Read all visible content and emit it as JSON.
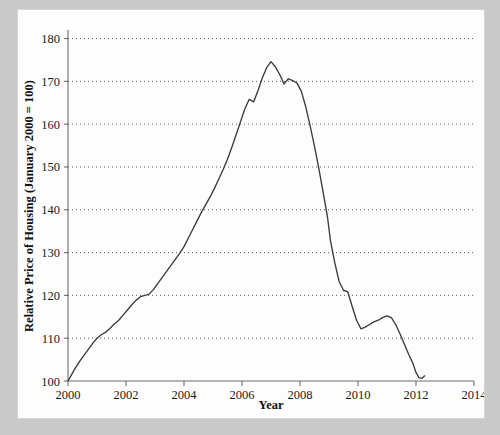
{
  "figure": {
    "background_color": "#c9c9c9",
    "panel_color": "#fdfdfd",
    "line_color": "#3b3b3b"
  },
  "chart_data": {
    "type": "line",
    "title": "",
    "xlabel": "Year",
    "ylabel": "Relative Price of Housing (January 2000 = 100)",
    "xlim": [
      2000,
      2014
    ],
    "ylim": [
      100,
      182
    ],
    "xticks": [
      2000,
      2002,
      2004,
      2006,
      2008,
      2010,
      2012,
      2014
    ],
    "xtick_labels": [
      "2000",
      "2002",
      "2004",
      "2006",
      "2008",
      "2010",
      "2012",
      "2014"
    ],
    "yticks": [
      100,
      110,
      120,
      130,
      140,
      150,
      160,
      170,
      180
    ],
    "ytick_labels": [
      "100",
      "110",
      "120",
      "130",
      "140",
      "150",
      "160",
      "170",
      "180"
    ],
    "grid": "horizontal-dotted",
    "legend": "none",
    "series": [
      {
        "name": "Relative Price of Housing",
        "x": [
          2000.0,
          2000.1,
          2000.25,
          2000.4,
          2000.55,
          2000.7,
          2000.85,
          2001.0,
          2001.15,
          2001.3,
          2001.45,
          2001.6,
          2001.75,
          2001.9,
          2002.05,
          2002.2,
          2002.35,
          2002.5,
          2002.65,
          2002.8,
          2002.95,
          2003.1,
          2003.25,
          2003.4,
          2003.55,
          2003.7,
          2003.85,
          2004.0,
          2004.15,
          2004.3,
          2004.45,
          2004.6,
          2004.75,
          2004.9,
          2005.05,
          2005.2,
          2005.35,
          2005.5,
          2005.65,
          2005.8,
          2005.95,
          2006.1,
          2006.25,
          2006.4,
          2006.55,
          2006.7,
          2006.85,
          2007.0,
          2007.15,
          2007.3,
          2007.45,
          2007.6,
          2007.75,
          2007.9,
          2008.05,
          2008.2,
          2008.35,
          2008.5,
          2008.65,
          2008.8,
          2008.95,
          2009.05,
          2009.2,
          2009.35,
          2009.5,
          2009.65,
          2009.8,
          2009.95,
          2010.1,
          2010.25,
          2010.4,
          2010.55,
          2010.7,
          2010.85,
          2011.0,
          2011.15,
          2011.3,
          2011.45,
          2011.6,
          2011.75,
          2011.9,
          2012.0,
          2012.1,
          2012.2,
          2012.3
        ],
        "y": [
          100.0,
          101.2,
          103.0,
          104.6,
          106.0,
          107.4,
          108.8,
          110.0,
          110.8,
          111.4,
          112.3,
          113.3,
          114.2,
          115.4,
          116.6,
          117.8,
          118.9,
          119.7,
          120.0,
          120.3,
          121.4,
          122.8,
          124.2,
          125.6,
          127.0,
          128.4,
          129.8,
          131.4,
          133.4,
          135.4,
          137.4,
          139.4,
          141.2,
          143.0,
          145.0,
          147.2,
          149.4,
          151.8,
          154.6,
          157.6,
          160.6,
          163.6,
          165.8,
          165.2,
          167.8,
          170.8,
          173.2,
          174.6,
          173.4,
          171.6,
          169.4,
          170.6,
          170.2,
          169.6,
          167.6,
          164.0,
          159.6,
          154.8,
          149.6,
          144.0,
          138.2,
          132.8,
          127.6,
          123.2,
          121.2,
          120.8,
          117.4,
          114.2,
          112.2,
          112.6,
          113.2,
          113.8,
          114.2,
          114.8,
          115.2,
          114.8,
          113.2,
          111.0,
          108.6,
          106.2,
          104.0,
          102.0,
          100.8,
          100.6,
          101.2
        ]
      }
    ]
  }
}
